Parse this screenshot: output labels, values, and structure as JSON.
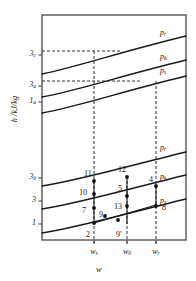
{
  "chart_data": {
    "type": "line",
    "title": "",
    "xlabel": "w",
    "ylabel": "h /kJ/kg",
    "axes": {
      "frame_color": "#555555",
      "plot_left": 42,
      "plot_right": 186,
      "plot_top": 15,
      "plot_bottom": 240
    },
    "y_ticks": [
      {
        "label_main": "3",
        "label_sub": "c",
        "y": 55
      },
      {
        "label_main": "3",
        "label_sub": "a",
        "y": 86
      },
      {
        "label_main": "1",
        "label_sub": "a",
        "y": 102
      },
      {
        "label_main": "3",
        "label_sub": "b",
        "y": 178
      },
      {
        "label_main": "3",
        "label_sub": "",
        "y": 201
      },
      {
        "label_main": "1",
        "label_sub": "",
        "y": 224
      }
    ],
    "x_ticks": [
      {
        "label_main": "w",
        "label_sub": "s",
        "x": 94
      },
      {
        "label_main": "w",
        "label_sub": "0",
        "x": 127
      },
      {
        "label_main": "w",
        "label_sub": "r",
        "x": 156
      }
    ],
    "isobars": [
      {
        "name": "p_r_top",
        "label_main": "p",
        "label_sub": "r",
        "label_x": 160,
        "label_y": 28,
        "path": "M42,74 C80,66 120,52 186,36"
      },
      {
        "name": "p_k_top",
        "label_main": "p",
        "label_sub": "k",
        "label_x": 160,
        "label_y": 52,
        "path": "M42,97 C80,90 120,76 186,60"
      },
      {
        "name": "p_s_top",
        "label_main": "p",
        "label_sub": "s",
        "label_x": 160,
        "label_y": 66,
        "path": "M42,113 C80,106 120,92 186,76"
      },
      {
        "name": "p_r_low",
        "label_main": "p",
        "label_sub": "r",
        "label_x": 160,
        "label_y": 143,
        "path": "M42,186 C80,180 120,168 186,152"
      },
      {
        "name": "p_k_low",
        "label_main": "p",
        "label_sub": "k",
        "label_x": 160,
        "label_y": 172,
        "path": "M42,209 C80,203 120,191 186,175"
      },
      {
        "name": "p_s_low",
        "label_main": "p",
        "label_sub": "s",
        "label_x": 160,
        "label_y": 196,
        "path": "M42,233 C80,227 120,215 186,199"
      }
    ],
    "dashed_horizontals": [
      {
        "name": "level-3c",
        "x1": 42,
        "x2": 120,
        "y": 51
      },
      {
        "name": "level-3a",
        "x1": 42,
        "x2": 142,
        "y": 81
      }
    ],
    "dashed_verticals": [
      {
        "name": "w-s-line",
        "x": 94,
        "y1": 51,
        "y2": 246
      },
      {
        "name": "w-0-line",
        "x": 127,
        "y1": 181,
        "y2": 246
      },
      {
        "name": "w-r-line",
        "x": 156,
        "y1": 81,
        "y2": 246
      }
    ],
    "process_segments": [
      {
        "name": "seg-2-11",
        "x1": 94,
        "y1": 223,
        "x2": 94,
        "y2": 181
      },
      {
        "name": "seg-12-9p",
        "x1": 127,
        "y1": 177,
        "x2": 127,
        "y2": 224
      },
      {
        "name": "seg-4-8",
        "x1": 156,
        "y1": 186,
        "x2": 156,
        "y2": 206
      },
      {
        "name": "seg-2-8",
        "x1": 94,
        "y1": 223,
        "x2": 156,
        "y2": 205
      }
    ],
    "points": [
      {
        "label": "11",
        "x": 94,
        "y": 181,
        "lx": 84,
        "ly": 169
      },
      {
        "label": "12",
        "x": 127,
        "y": 177,
        "lx": 118,
        "ly": 165
      },
      {
        "label": "10",
        "x": 94,
        "y": 194,
        "lx": 79,
        "ly": 188
      },
      {
        "label": "5",
        "x": 127,
        "y": 196,
        "lx": 118,
        "ly": 184
      },
      {
        "label": "4",
        "x": 156,
        "y": 186,
        "lx": 149,
        "ly": 175
      },
      {
        "label": "13",
        "x": 127,
        "y": 206,
        "lx": 114,
        "ly": 202
      },
      {
        "label": "8",
        "x": 156,
        "y": 206,
        "lx": 162,
        "ly": 203
      },
      {
        "label": "7",
        "x": 94,
        "y": 208,
        "lx": 82,
        "ly": 206
      },
      {
        "label": "9",
        "x": 105,
        "y": 216,
        "lx": 99,
        "ly": 210
      },
      {
        "label": "2",
        "x": 94,
        "y": 223,
        "lx": 86,
        "ly": 230
      },
      {
        "label": "9'",
        "x": 118,
        "y": 220,
        "lx": 116,
        "ly": 230
      }
    ],
    "point_color": "#111111",
    "line_color": "#1a1a1a"
  }
}
